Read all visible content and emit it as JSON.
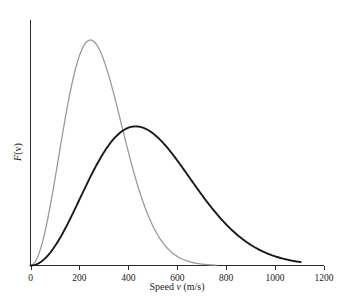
{
  "chart_data": {
    "type": "line",
    "title": "",
    "xlabel": "Speed v (m/s)",
    "xlabel_parts": {
      "pre": "Speed ",
      "italic": "v",
      "post": " (m/s)"
    },
    "ylabel": "F(v)",
    "ylabel_parts": {
      "italic": "F",
      "post": "(v)"
    },
    "xlim": [
      0,
      1200
    ],
    "ylim": [
      0,
      1.08
    ],
    "xticks": [
      0,
      200,
      400,
      600,
      800,
      1000,
      1200
    ],
    "xticklabels": [
      "0",
      "200",
      "400",
      "600",
      "800",
      "1000",
      "1200"
    ],
    "yticks": [],
    "yticklabels": [],
    "grid": false,
    "legend": "none",
    "series": [
      {
        "name": "grey-distribution",
        "color": "#9a9a9a",
        "linewidth": 1.3,
        "peak_x": 245,
        "peak_y": 1.0,
        "most_probable_speed": 245,
        "x": [
          0,
          25,
          50,
          75,
          100,
          125,
          150,
          175,
          200,
          225,
          245,
          250,
          275,
          300,
          325,
          350,
          375,
          400,
          425,
          450,
          475,
          500,
          525,
          550,
          575,
          600,
          625,
          650,
          675,
          700,
          725,
          750
        ],
        "values": [
          0.0,
          0.028,
          0.105,
          0.218,
          0.353,
          0.493,
          0.623,
          0.733,
          0.841,
          0.916,
          1.0,
          0.965,
          0.986,
          0.962,
          0.906,
          0.822,
          0.719,
          0.607,
          0.494,
          0.387,
          0.292,
          0.212,
          0.148,
          0.1,
          0.065,
          0.04,
          0.024,
          0.014,
          0.008,
          0.004,
          0.002,
          0.0
        ]
      },
      {
        "name": "black-distribution",
        "color": "#1a1a1a",
        "linewidth": 1.9,
        "peak_x": 430,
        "peak_y": 0.62,
        "most_probable_speed": 430,
        "x": [
          0,
          50,
          100,
          150,
          200,
          250,
          300,
          350,
          400,
          430,
          450,
          500,
          550,
          600,
          650,
          700,
          750,
          800,
          850,
          900,
          950,
          1000,
          1050,
          1100
        ],
        "values": [
          0.0,
          0.012,
          0.047,
          0.1,
          0.17,
          0.25,
          0.34,
          0.43,
          0.52,
          0.62,
          0.59,
          0.6,
          0.55,
          0.48,
          0.4,
          0.32,
          0.245,
          0.18,
          0.125,
          0.085,
          0.055,
          0.033,
          0.018,
          0.008
        ]
      }
    ],
    "distribution_model": {
      "name": "maxwell-boltzmann",
      "grey_vp": 245,
      "black_vp": 430,
      "grey_amplitude": 1.0,
      "black_amplitude": 0.617,
      "grey_xmax": 760,
      "black_xmax": 1105
    }
  },
  "axes": {
    "x_axis_name": "x-axis",
    "y_axis_name": "y-axis",
    "tick_direction": "down"
  },
  "colors": {
    "background": "#ffffff",
    "axis": "#2b2b2b",
    "text": "#1a1a1a",
    "series_grey": "#9a9a9a",
    "series_black": "#1a1a1a"
  }
}
